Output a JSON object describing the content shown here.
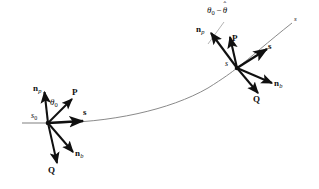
{
  "figure": {
    "background_color": "#ffffff",
    "curve_color": "#7a7a7a",
    "vector_color": "#101010",
    "leader_color": "#9a9a9a",
    "width": 319,
    "height": 189
  },
  "curve": {
    "label_end": "s",
    "description": "smooth curve rising left-to-right"
  },
  "frames": [
    {
      "id": "frame-initial",
      "origin_label": "s",
      "origin_subscript": "0",
      "angle_label": "θ",
      "angle_subscript": "0",
      "vectors": [
        {
          "name": "n-p",
          "label": "n",
          "subscript": "p"
        },
        {
          "name": "P",
          "label": "P",
          "subscript": ""
        },
        {
          "name": "s",
          "label": "s",
          "subscript": ""
        },
        {
          "name": "n-b",
          "label": "n",
          "subscript": "b"
        },
        {
          "name": "Q",
          "label": "Q",
          "subscript": ""
        }
      ]
    },
    {
      "id": "frame-current",
      "origin_label": "s",
      "origin_subscript": "",
      "angle_label_theta0": "θ",
      "angle_label_theta0_sub": "0",
      "angle_label_minus": "−",
      "angle_label_thetahat": "θ",
      "angle_label_hat": "ˆ",
      "vectors": [
        {
          "name": "n-p",
          "label": "n",
          "subscript": "p"
        },
        {
          "name": "P",
          "label": "P",
          "subscript": ""
        },
        {
          "name": "s",
          "label": "s",
          "subscript": ""
        },
        {
          "name": "n-b",
          "label": "n",
          "subscript": "b"
        },
        {
          "name": "Q",
          "label": "Q",
          "subscript": ""
        }
      ]
    }
  ]
}
